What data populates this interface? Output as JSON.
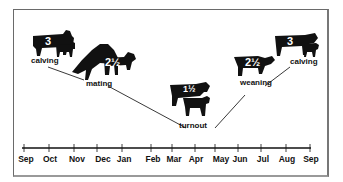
{
  "diagram": {
    "type": "cattle-production-cycle",
    "events": [
      {
        "id": "calving-1",
        "label": "calving",
        "score": "3",
        "month_position": "Sep"
      },
      {
        "id": "mating",
        "label": "mating",
        "score": "2½",
        "month_position": "Nov"
      },
      {
        "id": "turnout",
        "label": "turnout",
        "score": "1½",
        "month_position": "Apr"
      },
      {
        "id": "weaning",
        "label": "weaning",
        "score": "2½",
        "month_position": "Jun"
      },
      {
        "id": "calving-2",
        "label": "calving",
        "score": "3",
        "month_position": "Aug"
      }
    ],
    "timeline": {
      "months": [
        "Sep",
        "Oct",
        "Nov",
        "Dec",
        "Jan",
        "Feb",
        "Mar",
        "Apr",
        "May",
        "Jun",
        "Jul",
        "Aug",
        "Sep"
      ]
    },
    "colors": {
      "silhouette": "#111111",
      "line": "#222222",
      "background": "#ffffff",
      "border": "#6a6a6a"
    }
  }
}
